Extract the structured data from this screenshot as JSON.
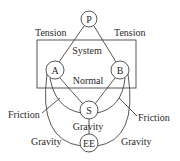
{
  "diagram": {
    "system_label": "System",
    "nodes": {
      "P": "P",
      "A": "A",
      "B": "B",
      "S": "S",
      "EE": "EE"
    },
    "edges": {
      "P_A": "Tension",
      "P_B": "Tension",
      "A_B": "Normal",
      "A_S_friction": "Friction",
      "B_S_friction": "Friction",
      "S_EE": "Gravity",
      "A_EE": "Gravity",
      "B_EE": "Gravity"
    }
  }
}
